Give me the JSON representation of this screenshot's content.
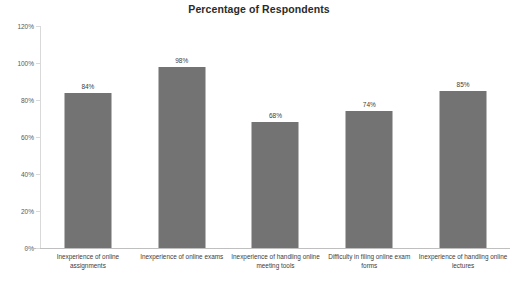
{
  "chart_data": {
    "type": "bar",
    "title": "Percentage of Respondents",
    "xlabel": "",
    "ylabel": "",
    "ylim": [
      0,
      120
    ],
    "grid": false,
    "legend": false,
    "y_ticks": [
      "0%",
      "20%",
      "40%",
      "60%",
      "80%",
      "100%",
      "120%"
    ],
    "y_tick_values": [
      0,
      20,
      40,
      60,
      80,
      100,
      120
    ],
    "categories": [
      "Inexperience of online assignments",
      "Inexperience of online exams",
      "Inexperience of handling online meeting tools",
      "Difficulty in filing online exam forms",
      "Inexperience of handling online lectures"
    ],
    "values": [
      84,
      98,
      68,
      74,
      85
    ],
    "value_labels": [
      "84%",
      "98%",
      "68%",
      "74%",
      "85%"
    ],
    "bar_color": "#737373"
  }
}
